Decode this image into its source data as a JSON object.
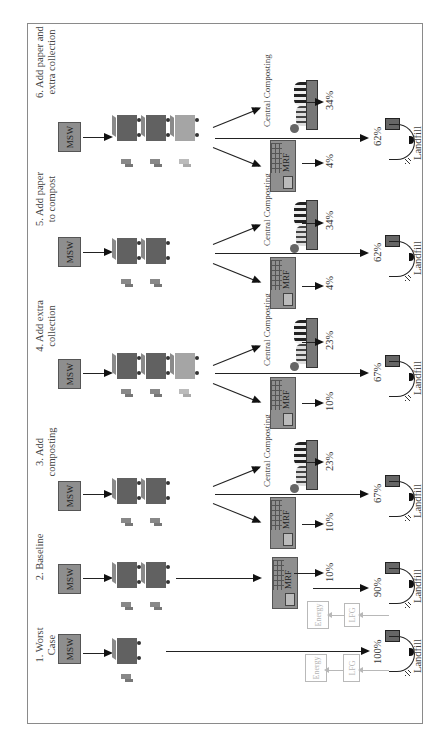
{
  "diagram": {
    "orientation": "rotated 90 degrees counter-clockwise",
    "node_labels": {
      "source": "MSW",
      "mrf": "MRF",
      "compost": "Central Composting",
      "landfill": "Landfill",
      "lfg": "LFG",
      "energy": "Energy"
    },
    "scenarios": [
      {
        "id": 1,
        "title": "1. Worst Case",
        "title_lines": [
          "1. Worst",
          "Case"
        ],
        "bins": 1,
        "mrf_pct": null,
        "compost_pct": null,
        "landfill_pct": "100%",
        "lfg_energy": true
      },
      {
        "id": 2,
        "title": "2. Baseline",
        "title_lines": [
          "2. Baseline"
        ],
        "bins": 2,
        "mrf_pct": "10%",
        "compost_pct": null,
        "landfill_pct": "90%",
        "lfg_energy": true
      },
      {
        "id": 3,
        "title": "3. Add composting",
        "title_lines": [
          "3. Add",
          "composting"
        ],
        "bins": 2,
        "mrf_pct": "10%",
        "compost_pct": "23%",
        "landfill_pct": "67%",
        "lfg_energy": false
      },
      {
        "id": 4,
        "title": "4. Add extra collection",
        "title_lines": [
          "4. Add extra",
          "collection"
        ],
        "bins": 3,
        "mrf_pct": "10%",
        "compost_pct": "23%",
        "landfill_pct": "67%",
        "lfg_energy": false
      },
      {
        "id": 5,
        "title": "5. Add paper to compost",
        "title_lines": [
          "5. Add paper",
          "to compost"
        ],
        "bins": 2,
        "mrf_pct": "4%",
        "compost_pct": "34%",
        "landfill_pct": "62%",
        "lfg_energy": false
      },
      {
        "id": 6,
        "title": "6. Add paper and extra collection",
        "title_lines": [
          "6. Add paper and",
          "extra collection"
        ],
        "bins": 3,
        "mrf_pct": "4%",
        "compost_pct": "34%",
        "landfill_pct": "62%",
        "lfg_energy": false
      }
    ]
  },
  "colors": {
    "msw_box": "#8e8e8e",
    "bin_dark": "#616161",
    "bin_light": "#a5a5a5",
    "arrow": "#111111",
    "ghost": "#b9b9b9",
    "frame": "#8a8a8a"
  }
}
